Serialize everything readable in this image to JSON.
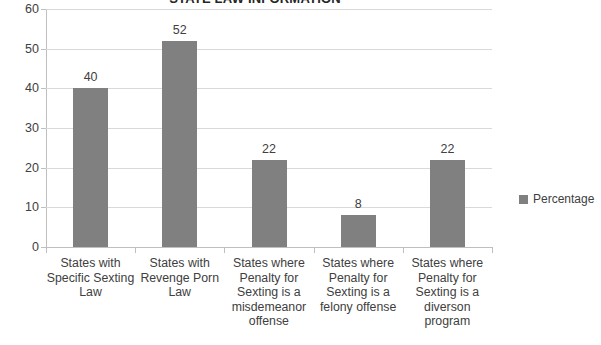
{
  "chart_data": {
    "type": "bar",
    "title": "STATE LAW INFORMATION",
    "xlabel": "",
    "ylabel": "",
    "ylim": [
      0,
      60
    ],
    "ytick_step": 10,
    "yticks": [
      "60",
      "50",
      "40",
      "30",
      "20",
      "10",
      "0"
    ],
    "grid": true,
    "legend_position": "right",
    "categories": [
      "States with Specific Sexting Law",
      "States with Revenge Porn Law",
      "States where Penalty for Sexting is a misdemeanor offense",
      "States where Penalty for Sexting is a felony offense",
      "States where Penalty for Sexting is a diverson program"
    ],
    "category_lines": [
      [
        "States with",
        "Specific Sexting",
        "Law"
      ],
      [
        "States with",
        "Revenge Porn",
        "Law"
      ],
      [
        "States where",
        "Penalty for",
        "Sexting is a",
        "misdemeanor",
        "offense"
      ],
      [
        "States where",
        "Penalty for",
        "Sexting is a",
        "felony offense"
      ],
      [
        "States where",
        "Penalty for",
        "Sexting is a",
        "diverson",
        "program"
      ]
    ],
    "series": [
      {
        "name": "Percentage",
        "values": [
          40,
          52,
          22,
          8,
          22
        ],
        "color": "#808080"
      }
    ],
    "value_labels": [
      "40",
      "52",
      "22",
      "8",
      "22"
    ]
  },
  "legend": {
    "entries": [
      {
        "label": "Percentage",
        "color": "#808080"
      }
    ]
  },
  "colors": {
    "bar": "#808080",
    "gridline": "#d9d9d9",
    "axis": "#bfbfbf",
    "text": "#404040",
    "background": "#ffffff"
  }
}
